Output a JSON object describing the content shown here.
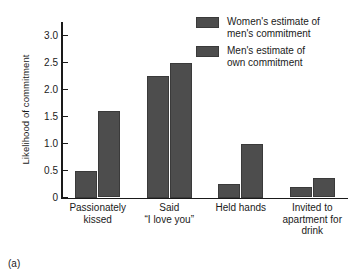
{
  "chart_data": {
    "type": "bar",
    "title": "",
    "xlabel": "",
    "ylabel": "Likelihood of commitment",
    "ylim": [
      0,
      3.25
    ],
    "yticks": [
      "0",
      "0.5",
      "1.0",
      "1.5",
      "2.0",
      "2.5",
      "3.0"
    ],
    "ytick_values": [
      0,
      0.5,
      1.0,
      1.5,
      2.0,
      2.5,
      3.0
    ],
    "grid": false,
    "legend_position": "top-right",
    "categories": [
      "Passionately\nkissed",
      "Said\n“I love you”",
      "Held hands",
      "Invited to\napartment for\ndrink"
    ],
    "category_lines": [
      [
        "Passionately",
        "kissed"
      ],
      [
        "Said",
        "“I love you”"
      ],
      [
        "Held hands"
      ],
      [
        "Invited to",
        "apartment for",
        "drink"
      ]
    ],
    "series": [
      {
        "name": "Women's estimate of men's commitment",
        "name_lines": [
          "Women's estimate of",
          "men's commitment"
        ],
        "color": "#4d4d4d",
        "values": [
          0.5,
          2.25,
          0.25,
          0.2
        ]
      },
      {
        "name": "Men's estimate of own commitment",
        "name_lines": [
          "Men's estimate of",
          "own commitment"
        ],
        "color": "#4d4d4d",
        "values": [
          1.6,
          2.5,
          1.0,
          0.37
        ]
      }
    ]
  },
  "caption": "(a)",
  "colors": {
    "bar": "#4d4d4d",
    "bar_edge": "#3a3a3a",
    "axis": "#1a1a1a",
    "background": "#ffffff"
  }
}
